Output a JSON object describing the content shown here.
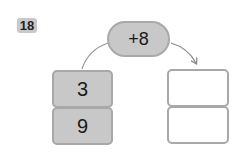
{
  "problem": {
    "number": "18",
    "operation": "+8",
    "input_values": [
      "3",
      "9"
    ],
    "output_values": [
      "",
      ""
    ]
  },
  "colors": {
    "fill": "#c8c8c8",
    "border": "#a8a8a8",
    "arrow": "#888888"
  }
}
